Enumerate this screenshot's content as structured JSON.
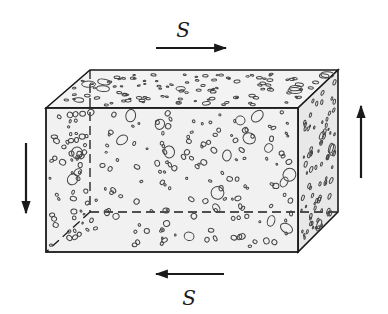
{
  "diagram": {
    "labels": {
      "top_force": "S",
      "bottom_force": "S"
    },
    "arrows": [
      {
        "name": "top-shear",
        "direction": "right"
      },
      {
        "name": "bottom-shear",
        "direction": "left"
      },
      {
        "name": "left-shear",
        "direction": "down"
      },
      {
        "name": "right-shear",
        "direction": "up"
      }
    ],
    "colors": {
      "line": "#1a1a1a",
      "face_fill": "#f1f1f1",
      "side_fill": "#e6e6e6",
      "pore_stroke": "#444444"
    }
  }
}
